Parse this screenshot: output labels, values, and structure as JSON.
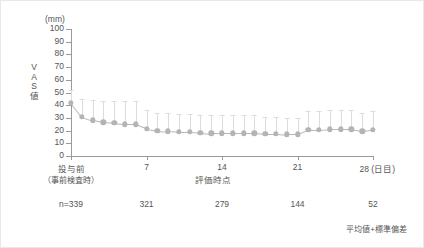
{
  "figure": {
    "unit_label": "(mm)",
    "y_axis_title_chars": [
      "V",
      "A",
      "S",
      "値"
    ],
    "x_axis_title": "評価時点",
    "note": "平均値+標準偏差"
  },
  "sample_sizes": [
    {
      "label": "n=339",
      "day": 0
    },
    {
      "label": "321",
      "day": 7
    },
    {
      "label": "279",
      "day": 14
    },
    {
      "label": "144",
      "day": 21
    },
    {
      "label": "52",
      "day": 28
    }
  ],
  "chart_data": {
    "type": "line",
    "title": "",
    "subtitle": "",
    "xlabel": "評価時点",
    "ylabel": "VAS値",
    "unit": "mm",
    "note": "平均値+標準偏差",
    "grid": false,
    "legend": "none",
    "xlim": [
      0,
      28
    ],
    "ylim": [
      0,
      100
    ],
    "ytick_labels": [
      "100",
      "90",
      "80",
      "70",
      "60",
      "50",
      "40",
      "30",
      "20",
      "10",
      "0"
    ],
    "ytick_values": [
      100,
      90,
      80,
      70,
      60,
      50,
      40,
      30,
      20,
      10,
      0
    ],
    "xtick_values": [
      0,
      7,
      14,
      21,
      28
    ],
    "xtick_labels": [
      "投与前",
      "7",
      "14",
      "21",
      "28"
    ],
    "xtick_sublabels": [
      "（事前検査時）",
      "",
      "",
      "",
      ""
    ],
    "x_unit_suffix": "(日目)",
    "x": [
      0,
      1,
      2,
      3,
      4,
      5,
      6,
      7,
      8,
      9,
      10,
      11,
      12,
      13,
      14,
      15,
      16,
      17,
      18,
      19,
      20,
      21,
      22,
      23,
      24,
      25,
      26,
      27,
      28
    ],
    "series": [
      {
        "name": "VAS値 平均値",
        "marker": "circle",
        "color": "#b4b4b4",
        "errorbar_color": "#dcdcdc",
        "values": [
          42,
          31,
          28,
          26.5,
          26,
          25,
          25,
          21.5,
          20,
          19.5,
          19,
          19,
          18.5,
          18,
          18,
          18,
          18,
          18,
          17.5,
          17.5,
          17,
          17,
          20.5,
          20.5,
          21,
          21,
          21,
          19.5,
          20.5
        ],
        "sd": [
          10,
          14,
          16,
          17,
          17.5,
          18,
          18,
          15,
          14,
          14,
          14,
          14,
          14,
          14,
          14,
          14,
          14,
          14,
          13.5,
          13.5,
          13,
          13,
          15,
          15,
          15.5,
          15.5,
          15.5,
          14.5,
          15
        ]
      }
    ]
  }
}
